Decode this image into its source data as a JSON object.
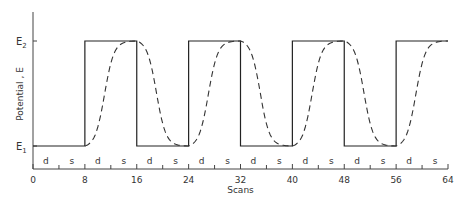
{
  "chart_data": {
    "type": "line",
    "title": "",
    "xlabel": "Scans",
    "ylabel": "Potential , E",
    "xlim": [
      0,
      64
    ],
    "x_ticks": [
      0,
      8,
      16,
      24,
      32,
      40,
      48,
      56,
      64
    ],
    "x_tick_labels": [
      "0",
      "8",
      "16",
      "24",
      "32",
      "40",
      "48",
      "56",
      "64"
    ],
    "y_ticks": [
      "E1",
      "E2"
    ],
    "y_tick_labels": [
      {
        "base": "E",
        "sub": "1"
      },
      {
        "base": "E",
        "sub": "2"
      }
    ],
    "grid": false,
    "legend": null,
    "segment_labels": [
      "d",
      "s",
      "d",
      "s",
      "d",
      "s",
      "d",
      "s",
      "d",
      "s",
      "d",
      "s",
      "d",
      "s",
      "d",
      "s"
    ],
    "series": [
      {
        "name": "Applied potential (square wave)",
        "style": "solid",
        "x": [
          0,
          8,
          8,
          16,
          16,
          24,
          24,
          32,
          32,
          40,
          40,
          48,
          48,
          56,
          56,
          64
        ],
        "values": [
          "E1",
          "E1",
          "E2",
          "E2",
          "E1",
          "E1",
          "E2",
          "E2",
          "E1",
          "E1",
          "E2",
          "E2",
          "E1",
          "E1",
          "E2",
          "E2"
        ]
      },
      {
        "name": "Response potential (lagging)",
        "style": "dashed",
        "description": "Sigmoidal transitions lagging the square wave; reaches E2 near end of each high half-period and E1 near end of each low half-period",
        "x": [
          8,
          12,
          16,
          20,
          24,
          28,
          32,
          36,
          40,
          44,
          48,
          52,
          56,
          60,
          64
        ],
        "values": [
          "E1",
          "~E2",
          "E2",
          "~E1",
          "E1",
          "~E2",
          "E2",
          "~E1",
          "E1",
          "~E2",
          "E2",
          "~E1",
          "E1",
          "~E2",
          "E2"
        ]
      }
    ]
  }
}
